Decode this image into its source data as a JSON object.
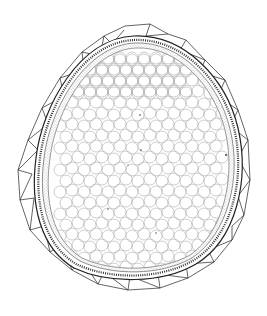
{
  "figure": {
    "type": "botanical cross-section line drawing",
    "background": "#ffffff",
    "stroke_color": "#1a1a1a",
    "layers": [
      "outer irregular cortex cells",
      "banded ring",
      "stippled ring",
      "inner rounded parenchyma cells"
    ],
    "text": []
  }
}
